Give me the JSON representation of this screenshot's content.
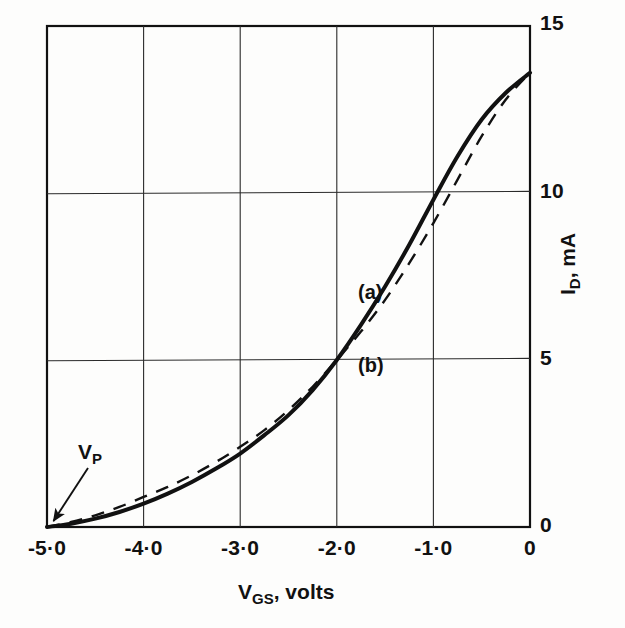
{
  "chart_data": {
    "type": "line",
    "title": "",
    "xlabel": "V_GS, volts",
    "ylabel": "I_D, mA",
    "xlabel_main": "V",
    "xlabel_sub": "GS",
    "xlabel_tail": ", volts",
    "ylabel_main": "I",
    "ylabel_sub": "D",
    "ylabel_tail": ", mA",
    "xlim": [
      -5.0,
      0.0
    ],
    "ylim": [
      0,
      15
    ],
    "grid": true,
    "x_ticks": [
      "-5·0",
      "-4·0",
      "-3·0",
      "-2·0",
      "-1·0",
      "0"
    ],
    "x_tick_values": [
      -5.0,
      -4.0,
      -3.0,
      -2.0,
      -1.0,
      0.0
    ],
    "y_ticks": [
      "0",
      "5",
      "10",
      "15"
    ],
    "y_tick_values": [
      0,
      5,
      10,
      15
    ],
    "legend_position": "inline-annotation",
    "annotations": [
      {
        "text": "V_P",
        "main": "V",
        "sub": "P",
        "x": -4.55,
        "y": 1.65,
        "points_to": {
          "x": -5.0,
          "y": 0.0
        }
      },
      {
        "text": "(a)",
        "x": -1.85,
        "y": 7.35
      },
      {
        "text": "(b)",
        "x": -1.85,
        "y": 5.15
      }
    ],
    "series": [
      {
        "name": "(a)",
        "style": "solid",
        "color": "#111111",
        "description": "Square-law transfer characteristic I_D = I_DSS (1 - V_GS/V_P)^2",
        "x": [
          -5.0,
          -4.75,
          -4.5,
          -4.25,
          -4.0,
          -3.75,
          -3.5,
          -3.25,
          -3.0,
          -2.75,
          -2.5,
          -2.25,
          -2.0,
          -1.75,
          -1.5,
          -1.25,
          -1.0,
          -0.75,
          -0.5,
          -0.25,
          0.0
        ],
        "y": [
          0.0,
          0.1,
          0.25,
          0.45,
          0.7,
          1.0,
          1.35,
          1.75,
          2.2,
          2.75,
          3.35,
          4.1,
          5.0,
          6.05,
          7.2,
          8.45,
          9.8,
          11.1,
          12.2,
          13.0,
          13.6
        ]
      },
      {
        "name": "(b)",
        "style": "dashed",
        "color": "#111111",
        "description": "Alternative / approximate characteristic, crosses curve (a) at V_GS = -2.0 V",
        "x": [
          -5.0,
          -4.75,
          -4.5,
          -4.25,
          -4.0,
          -3.75,
          -3.5,
          -3.25,
          -3.0,
          -2.75,
          -2.5,
          -2.25,
          -2.0,
          -1.75,
          -1.5,
          -1.25,
          -1.0,
          -0.75,
          -0.5,
          -0.25,
          0.0
        ],
        "y": [
          0.0,
          0.15,
          0.35,
          0.6,
          0.9,
          1.2,
          1.55,
          1.95,
          2.4,
          2.9,
          3.5,
          4.2,
          5.0,
          5.85,
          6.8,
          7.9,
          9.1,
          10.4,
          11.7,
          12.8,
          13.6
        ]
      }
    ]
  },
  "plot_box": {
    "left": 47,
    "top": 26,
    "right": 530,
    "bottom": 527
  }
}
